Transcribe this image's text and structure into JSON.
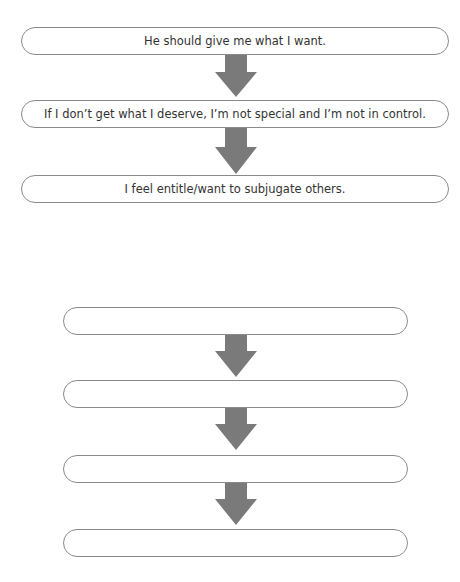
{
  "example_flow": {
    "steps": [
      {
        "text": "He should give me what I want."
      },
      {
        "text": "If I don’t get what I deserve, I’m not special and I’m not in control."
      },
      {
        "text": "I feel entitle/want to subjugate others."
      }
    ]
  },
  "blank_flow": {
    "steps": [
      {
        "text": ""
      },
      {
        "text": ""
      },
      {
        "text": ""
      },
      {
        "text": ""
      }
    ]
  },
  "colors": {
    "arrow": "#7a7a7a",
    "box_border": "#8a8a8a",
    "text": "#333333"
  }
}
